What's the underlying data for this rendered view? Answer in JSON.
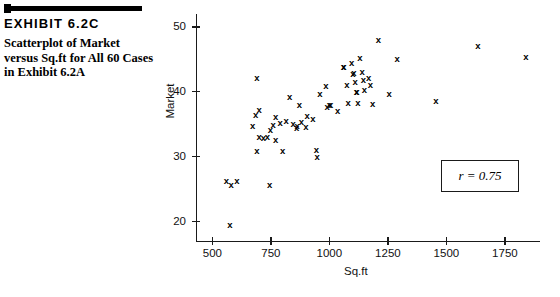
{
  "exhibit": {
    "title": "EXHIBIT 6.2C",
    "caption": "Scatterplot of Market versus Sq.ft for All 60 Cases in Exhibit 6.2A"
  },
  "annotation": {
    "correlation_text": "r = 0.75"
  },
  "chart_data": {
    "type": "scatter",
    "title": "Scatterplot of Market versus Sq.ft for All 60 Cases in Exhibit 6.2A",
    "xlabel": "Sq.ft",
    "ylabel": "Market",
    "xlim": [
      430,
      1900
    ],
    "ylim": [
      17,
      52
    ],
    "xticks": [
      500,
      750,
      1000,
      1250,
      1500,
      1750
    ],
    "yticks": [
      20,
      30,
      40,
      50
    ],
    "grid": false,
    "legend": null,
    "marker": "x",
    "n_points": 60,
    "correlation": 0.75,
    "points": [
      {
        "x": 560,
        "y": 26.2
      },
      {
        "x": 580,
        "y": 25.7
      },
      {
        "x": 605,
        "y": 26.3
      },
      {
        "x": 575,
        "y": 19.5
      },
      {
        "x": 690,
        "y": 42.2
      },
      {
        "x": 700,
        "y": 37.2
      },
      {
        "x": 685,
        "y": 36.4
      },
      {
        "x": 672,
        "y": 34.8
      },
      {
        "x": 700,
        "y": 33.0
      },
      {
        "x": 718,
        "y": 32.9
      },
      {
        "x": 690,
        "y": 30.9
      },
      {
        "x": 745,
        "y": 25.6
      },
      {
        "x": 770,
        "y": 36.1
      },
      {
        "x": 760,
        "y": 34.9
      },
      {
        "x": 790,
        "y": 35.2
      },
      {
        "x": 748,
        "y": 34.1
      },
      {
        "x": 735,
        "y": 33.0
      },
      {
        "x": 770,
        "y": 32.6
      },
      {
        "x": 800,
        "y": 30.9
      },
      {
        "x": 830,
        "y": 39.2
      },
      {
        "x": 815,
        "y": 35.5
      },
      {
        "x": 845,
        "y": 35.0
      },
      {
        "x": 860,
        "y": 34.5
      },
      {
        "x": 862,
        "y": 34.7
      },
      {
        "x": 880,
        "y": 35.4
      },
      {
        "x": 900,
        "y": 34.6
      },
      {
        "x": 872,
        "y": 38.0
      },
      {
        "x": 905,
        "y": 36.2
      },
      {
        "x": 930,
        "y": 35.8
      },
      {
        "x": 945,
        "y": 31.0
      },
      {
        "x": 948,
        "y": 29.9
      },
      {
        "x": 960,
        "y": 39.6
      },
      {
        "x": 985,
        "y": 40.9
      },
      {
        "x": 990,
        "y": 37.6
      },
      {
        "x": 1000,
        "y": 37.9
      },
      {
        "x": 1005,
        "y": 38.0
      },
      {
        "x": 1035,
        "y": 37.1
      },
      {
        "x": 1060,
        "y": 43.8
      },
      {
        "x": 1062,
        "y": 43.8
      },
      {
        "x": 1075,
        "y": 41.0
      },
      {
        "x": 1080,
        "y": 38.3
      },
      {
        "x": 1095,
        "y": 44.5
      },
      {
        "x": 1100,
        "y": 42.8
      },
      {
        "x": 1105,
        "y": 42.9
      },
      {
        "x": 1110,
        "y": 41.5
      },
      {
        "x": 1115,
        "y": 40.0
      },
      {
        "x": 1118,
        "y": 39.9
      },
      {
        "x": 1122,
        "y": 38.3
      },
      {
        "x": 1130,
        "y": 45.2
      },
      {
        "x": 1140,
        "y": 43.0
      },
      {
        "x": 1145,
        "y": 41.8
      },
      {
        "x": 1150,
        "y": 40.3
      },
      {
        "x": 1168,
        "y": 42.2
      },
      {
        "x": 1175,
        "y": 41.1
      },
      {
        "x": 1185,
        "y": 38.2
      },
      {
        "x": 1210,
        "y": 48.0
      },
      {
        "x": 1255,
        "y": 39.6
      },
      {
        "x": 1290,
        "y": 45.0
      },
      {
        "x": 1455,
        "y": 38.6
      },
      {
        "x": 1635,
        "y": 47.0
      },
      {
        "x": 1840,
        "y": 45.4
      }
    ]
  }
}
